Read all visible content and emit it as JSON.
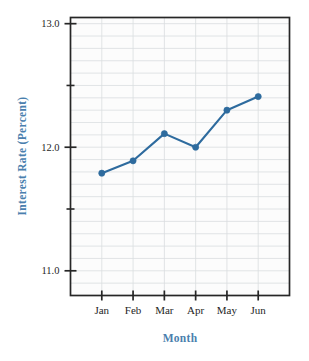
{
  "chart_data": {
    "type": "line",
    "title": "",
    "xlabel": "Month",
    "ylabel": "Interest Rate (Percent)",
    "categories": [
      "Jan",
      "Feb",
      "Mar",
      "Apr",
      "May",
      "Jun"
    ],
    "values": [
      11.79,
      11.89,
      12.11,
      12.0,
      12.3,
      12.41
    ],
    "series": [
      {
        "name": "Interest Rate",
        "values": [
          11.79,
          11.89,
          12.11,
          12.0,
          12.3,
          12.41
        ]
      }
    ],
    "ylim": [
      10.8,
      13.05
    ],
    "xlim": [
      0,
      7
    ],
    "y_major_ticks": [
      "11.0",
      "12.0",
      "13.0"
    ],
    "y_major_values": [
      11.0,
      12.0,
      13.0
    ],
    "y_minor_values": [
      11.5,
      12.5
    ],
    "y_gridline_step": 0.1,
    "grid": true,
    "legend": "none",
    "marker": "circle",
    "line_color": "#2e6b9e",
    "marker_color": "#2e6b9e",
    "grid_color": "#d9dde0",
    "axis_color": "#262626",
    "label_color": "#4a7fae",
    "tick_label_color": "#262626",
    "background_color": "#ffffff",
    "plot_background_color": "#fcfcfc"
  },
  "axes": {
    "y_title": "Interest Rate (Percent)",
    "x_title": "Month"
  },
  "y_ticks": [
    {
      "label": "13.0",
      "value": 13.0
    },
    {
      "label": "12.0",
      "value": 12.0
    },
    {
      "label": "11.0",
      "value": 11.0
    }
  ],
  "x_ticks": [
    {
      "label": "Jan"
    },
    {
      "label": "Feb"
    },
    {
      "label": "Mar"
    },
    {
      "label": "Apr"
    },
    {
      "label": "May"
    },
    {
      "label": "Jun"
    }
  ]
}
